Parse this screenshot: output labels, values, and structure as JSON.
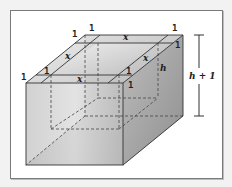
{
  "diagram": {
    "type": "open-box-3d",
    "labels": {
      "one": "1",
      "x": "x",
      "h": "h",
      "h_plus_1": "h + 1"
    },
    "colors": {
      "background": "#f2f2f2",
      "frame_border": "#7a7a7a",
      "box_edge": "#333333",
      "box_fill_dark": "#a9a9a9",
      "box_fill_light": "#e8e8e8"
    }
  }
}
